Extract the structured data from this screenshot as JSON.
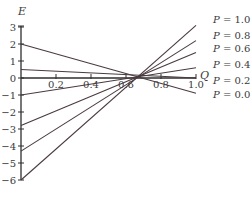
{
  "chart_data": {
    "type": "line",
    "title": "",
    "xlabel": "Q",
    "ylabel": "E",
    "xlim": [
      0,
      1.0
    ],
    "ylim": [
      -6,
      3
    ],
    "grid": false,
    "legend_position": "right, inline labels at line ends",
    "x_ticks": [
      0.2,
      0.4,
      0.6,
      0.8,
      1.0
    ],
    "x_tick_labels": [
      "0.2",
      "0.4",
      "0.6",
      "0.8",
      "1.0"
    ],
    "y_ticks": [
      3,
      2,
      1,
      0,
      -1,
      -2,
      -3,
      -4,
      -5,
      -6
    ],
    "y_tick_labels": [
      "3",
      "2",
      "1",
      "0",
      "−1",
      "−2",
      "−3",
      "−4",
      "−5",
      "−6"
    ],
    "x": [
      0.0,
      1.0
    ],
    "series": [
      {
        "name": "P = 1.0",
        "values": [
          -6.0,
          3.1
        ]
      },
      {
        "name": "P = 0.8",
        "values": [
          -4.3,
          2.2
        ]
      },
      {
        "name": "P = 0.6",
        "values": [
          -2.8,
          1.5
        ]
      },
      {
        "name": "P = 0.4",
        "values": [
          -1.0,
          0.6
        ]
      },
      {
        "name": "P = 0.2",
        "values": [
          0.5,
          0.0
        ]
      },
      {
        "name": "P = 0.0",
        "values": [
          2.0,
          -0.9
        ]
      }
    ],
    "annotations": [
      "Lines intersect near Q ≈ 0.65, E ≈ 0"
    ],
    "line_color": "#4a3a40"
  }
}
